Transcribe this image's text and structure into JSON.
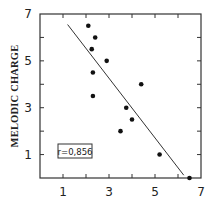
{
  "chart_data": {
    "type": "scatter",
    "title": "",
    "xlabel": "",
    "ylabel": "MELODIC CHARGE",
    "xlim": [
      0,
      7
    ],
    "ylim": [
      0,
      7
    ],
    "x_ticks": [
      1,
      2,
      3,
      4,
      5,
      6,
      7
    ],
    "x_tick_labels": [
      "1",
      "3",
      "5",
      "7"
    ],
    "y_ticks": [
      1,
      2,
      3,
      4,
      5,
      6,
      7
    ],
    "y_tick_labels": [
      "1",
      "3",
      "5",
      "7"
    ],
    "grid": false,
    "legend": null,
    "series": [
      {
        "name": "observations",
        "points": [
          {
            "x": 2.1,
            "y": 6.5
          },
          {
            "x": 2.4,
            "y": 6.0
          },
          {
            "x": 2.25,
            "y": 5.5
          },
          {
            "x": 2.9,
            "y": 5.0
          },
          {
            "x": 2.3,
            "y": 4.5
          },
          {
            "x": 2.3,
            "y": 3.5
          },
          {
            "x": 4.4,
            "y": 4.0
          },
          {
            "x": 3.75,
            "y": 3.0
          },
          {
            "x": 4.0,
            "y": 2.5
          },
          {
            "x": 3.5,
            "y": 2.0
          },
          {
            "x": 5.2,
            "y": 1.0
          },
          {
            "x": 6.5,
            "y": 0.0
          }
        ]
      }
    ],
    "regression_line": {
      "x1": 1.2,
      "y1": 6.55,
      "x2": 6.25,
      "y2": 0.12
    },
    "annotations": [
      {
        "text": "r=0,856",
        "boxed": true,
        "position": "lower-left"
      }
    ]
  }
}
